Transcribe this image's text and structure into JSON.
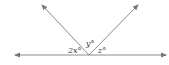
{
  "diagram": {
    "angles": [
      {
        "id": "left",
        "label": "2x°"
      },
      {
        "id": "middle",
        "label": "y°"
      },
      {
        "id": "right",
        "label": "z°"
      }
    ],
    "colors": {
      "line": "#888888",
      "text": "#333333"
    }
  }
}
